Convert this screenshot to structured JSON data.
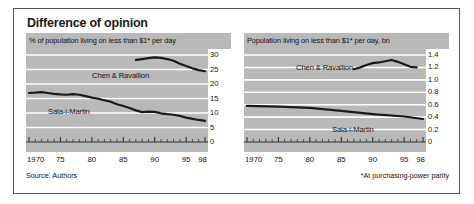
{
  "figure": {
    "title": "Difference of opinion",
    "source_note": "Source: Authors",
    "ppp_note": "*At purchasing-power parity"
  },
  "chart_data": [
    {
      "type": "line",
      "panel": "left",
      "title": "% of population living on less than $1* per day",
      "xlabel": "",
      "ylabel": "",
      "xlim": [
        1970,
        1998
      ],
      "ylim": [
        0,
        30
      ],
      "yticks": [
        0,
        5,
        10,
        15,
        20,
        25,
        30
      ],
      "ytick_labels": [
        "0",
        "5",
        "10",
        "15",
        "20",
        "25",
        "30"
      ],
      "xticks": [
        1970,
        1975,
        1980,
        1985,
        1990,
        1995,
        1998
      ],
      "xtick_labels": [
        "1970",
        "75",
        "80",
        "85",
        "90",
        "95",
        "98"
      ],
      "grid": true,
      "legend": "inline-annotations",
      "series": [
        {
          "name": "Chen & Ravallion",
          "x": [
            1987,
            1988,
            1989,
            1990,
            1991,
            1992,
            1993,
            1994,
            1995,
            1996,
            1997,
            1998
          ],
          "values": [
            28.3,
            28.6,
            28.9,
            29.2,
            29.0,
            28.6,
            28.0,
            27.0,
            26.2,
            25.4,
            24.8,
            24.4
          ]
        },
        {
          "name": "Sala-i-Martin",
          "x": [
            1970,
            1971,
            1972,
            1973,
            1974,
            1975,
            1976,
            1977,
            1978,
            1979,
            1980,
            1981,
            1982,
            1983,
            1984,
            1985,
            1986,
            1987,
            1988,
            1989,
            1990,
            1991,
            1992,
            1993,
            1994,
            1995,
            1996,
            1997,
            1998
          ],
          "values": [
            16.9,
            17.0,
            17.2,
            16.9,
            16.6,
            16.4,
            16.3,
            16.5,
            16.3,
            15.8,
            15.3,
            14.9,
            14.4,
            13.9,
            13.0,
            12.4,
            11.7,
            10.9,
            10.3,
            10.5,
            10.4,
            9.9,
            9.6,
            9.4,
            9.0,
            8.4,
            8.0,
            7.6,
            7.3
          ]
        }
      ]
    },
    {
      "type": "line",
      "panel": "right",
      "title": "Population living on less than $1* per day, bn",
      "xlabel": "",
      "ylabel": "",
      "xlim": [
        1970,
        1998
      ],
      "ylim": [
        0,
        1.4
      ],
      "yticks": [
        0,
        0.2,
        0.4,
        0.6,
        0.8,
        1.0,
        1.2,
        1.4
      ],
      "ytick_labels": [
        "0",
        "0.2",
        "0.4",
        "0.6",
        "0.8",
        "1.0",
        "1.2",
        "1.4"
      ],
      "xticks": [
        1970,
        1975,
        1980,
        1985,
        1990,
        1995,
        1998
      ],
      "xtick_labels": [
        "1970",
        "75",
        "80",
        "85",
        "90",
        "95",
        "98"
      ],
      "grid": true,
      "legend": "inline-annotations",
      "series": [
        {
          "name": "Chen & Ravallion",
          "x": [
            1987,
            1988,
            1989,
            1990,
            1991,
            1992,
            1993,
            1994,
            1995,
            1996,
            1997
          ],
          "values": [
            1.17,
            1.2,
            1.24,
            1.27,
            1.28,
            1.3,
            1.32,
            1.29,
            1.25,
            1.21,
            1.2
          ]
        },
        {
          "name": "Sala-i-Martin",
          "x": [
            1970,
            1975,
            1980,
            1985,
            1990,
            1995,
            1998
          ],
          "values": [
            0.58,
            0.57,
            0.55,
            0.5,
            0.45,
            0.41,
            0.37
          ]
        }
      ]
    }
  ],
  "annotations": {
    "left": {
      "chen_label": "Chen & Ravallion",
      "salai_label": "Sala-i-Martin"
    },
    "right": {
      "chen_label": "Chen & Ravallion",
      "salai_label": "Sala-i-Martin"
    }
  }
}
